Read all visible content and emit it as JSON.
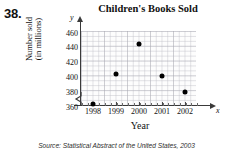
{
  "exercise": {
    "number": "38."
  },
  "chart_data": {
    "type": "scatter",
    "title": "Children's Books Sold",
    "xlabel": "Year",
    "ylabel_line1": "Number sold",
    "ylabel_line2": "(in millions)",
    "x_axis_letter": "x",
    "y_axis_letter": "y",
    "categories": [
      "1998",
      "1999",
      "2000",
      "2001",
      "2002"
    ],
    "x": [
      1998,
      1999,
      2000,
      2001,
      2002
    ],
    "values": [
      365,
      405,
      446,
      403,
      381
    ],
    "points": [
      {
        "x": "1998",
        "y": 365
      },
      {
        "x": "1999",
        "y": 405
      },
      {
        "x": "2000",
        "y": 446
      },
      {
        "x": "2001",
        "y": 403
      },
      {
        "x": "2002",
        "y": 381
      }
    ],
    "ytick_labels": [
      "460",
      "440",
      "420",
      "400",
      "380",
      "360"
    ],
    "ytick_values": [
      460,
      440,
      420,
      400,
      380,
      360
    ],
    "ylim": [
      355,
      465
    ],
    "xlim": [
      1997.6,
      2002.6
    ],
    "grid": true,
    "axis_break": true,
    "legend": null,
    "marker": "filled-circle",
    "marker_color": "#000000",
    "grid_color": "#bebec6",
    "axis_color": "#3a3a3a"
  },
  "source_note": "Source: Statistical Abstract of the United States, 2003"
}
